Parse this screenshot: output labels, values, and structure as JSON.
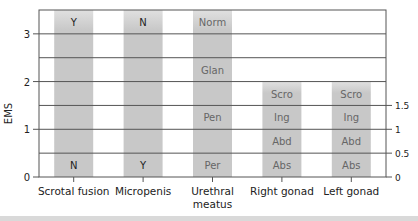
{
  "chart_data": {
    "type": "bar",
    "title": "",
    "xlabel": "",
    "ylabel": "EMS",
    "ylim": [
      0,
      3.5
    ],
    "yticks_left": [
      0,
      1,
      2,
      3
    ],
    "yticks_right": [
      0,
      0.5,
      1,
      1.5
    ],
    "grid": true,
    "categories": [
      "Scrotal fusion",
      "Micropenis",
      "Urethral meatus",
      "Right gonad",
      "Left gonad"
    ],
    "category_labels": [
      [
        "Scrotal fusion"
      ],
      [
        "Micropenis"
      ],
      [
        "Urethral",
        "meatus"
      ],
      [
        "Right gonad"
      ],
      [
        "Left gonad"
      ]
    ],
    "values": [
      3.5,
      3.5,
      3.5,
      2,
      2
    ],
    "segments": [
      {
        "category": "Scrotal fusion",
        "labels": [
          {
            "text": "N",
            "y": 0
          },
          {
            "text": "Y",
            "y": 3
          }
        ]
      },
      {
        "category": "Micropenis",
        "labels": [
          {
            "text": "Y",
            "y": 0
          },
          {
            "text": "N",
            "y": 3
          }
        ]
      },
      {
        "category": "Urethral meatus",
        "labels": [
          {
            "text": "Per",
            "y": 0
          },
          {
            "text": "Pen",
            "y": 1
          },
          {
            "text": "Glan",
            "y": 2
          },
          {
            "text": "Norm",
            "y": 3
          }
        ]
      },
      {
        "category": "Right gonad",
        "labels": [
          {
            "text": "Abs",
            "y": 0
          },
          {
            "text": "Abd",
            "y": 0.5
          },
          {
            "text": "Ing",
            "y": 1
          },
          {
            "text": "Scro",
            "y": 1.5
          }
        ]
      },
      {
        "category": "Left gonad",
        "labels": [
          {
            "text": "Abs",
            "y": 0
          },
          {
            "text": "Abd",
            "y": 0.5
          },
          {
            "text": "Ing",
            "y": 1
          },
          {
            "text": "Scro",
            "y": 1.5
          }
        ]
      }
    ],
    "colors": {
      "bar": "#c8c8c8",
      "bar_light": "#e0e0e0",
      "grid": "#555555",
      "frame": "#555555",
      "text": "#222222",
      "segment_text": "#666666"
    }
  }
}
